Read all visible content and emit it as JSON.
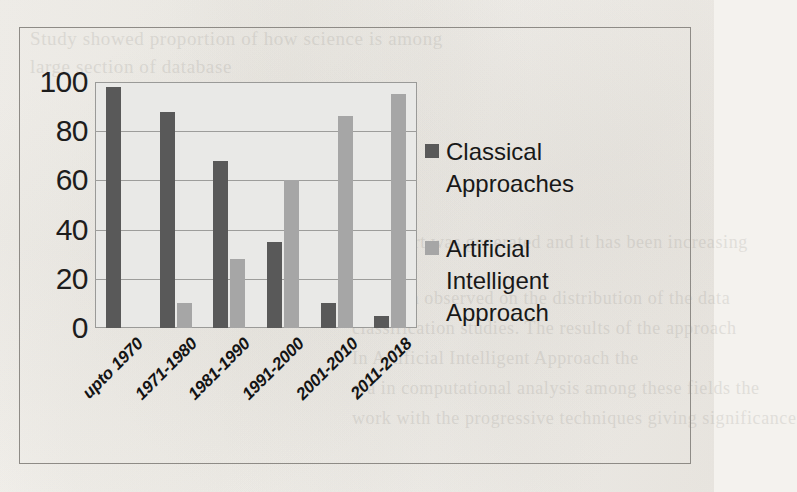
{
  "figure": {
    "border_color": "#8e8b86",
    "paper_color": "#f4f2ee"
  },
  "ghost_text": {
    "lines": [
      "Study showed proportion of how science is among",
      "large section of database",
      "The chart was generated and it has been increasing",
      "",
      "has been observed on the distribution of the data",
      "classification studies. The results of the approach",
      "In Artificial Intelligent Approach the",
      "era in computational analysis among these fields the",
      "work with the progressive techniques giving significance"
    ]
  },
  "chart_data": {
    "type": "bar",
    "title": "",
    "subtitle": "",
    "xlabel": "",
    "ylabel": "",
    "categories": [
      "upto 1970",
      "1971-1980",
      "1981-1990",
      "1991-2000",
      "2001-2010",
      "2011-2018"
    ],
    "series": [
      {
        "name": "Classical Approaches",
        "color": "#595959",
        "values": [
          98,
          88,
          68,
          35,
          10,
          5
        ]
      },
      {
        "name": "Artificial Intelligent Approach",
        "color": "#a6a6a6",
        "values": [
          0,
          10,
          28,
          60,
          86,
          95
        ]
      }
    ],
    "ylim": [
      0,
      100
    ],
    "yticks": [
      100,
      80,
      60,
      40,
      20,
      0
    ],
    "ytick_labels": [
      "100",
      "80",
      "60",
      "40",
      "20",
      "0"
    ],
    "grid": true,
    "grid_axis": "y",
    "grid_color": "#9d9d9b",
    "plot_background": "#e9e9e7",
    "legend_position": "right",
    "xtick_rotation": -45
  },
  "legend": {
    "entries": [
      {
        "label": "Classical Approaches",
        "color": "#595959",
        "swatch": "legend-swatch-classical"
      },
      {
        "label": "Artificial Intelligent Approach",
        "color": "#a6a6a6",
        "swatch": "legend-swatch-ai"
      }
    ]
  }
}
